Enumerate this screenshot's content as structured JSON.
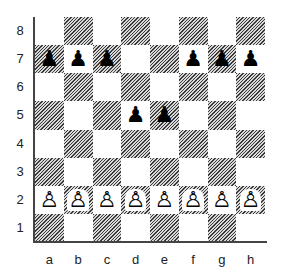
{
  "diagram": {
    "type": "chess-board",
    "ranks": [
      "8",
      "7",
      "6",
      "5",
      "4",
      "3",
      "2",
      "1"
    ],
    "files": [
      "a",
      "b",
      "c",
      "d",
      "e",
      "f",
      "g",
      "h"
    ],
    "pieces": {
      "a7": {
        "color": "black",
        "type": "pawn",
        "glyph": "♟"
      },
      "b7": {
        "color": "black",
        "type": "pawn",
        "glyph": "♟"
      },
      "c7": {
        "color": "black",
        "type": "pawn",
        "glyph": "♟"
      },
      "f7": {
        "color": "black",
        "type": "pawn",
        "glyph": "♟"
      },
      "g7": {
        "color": "black",
        "type": "pawn",
        "glyph": "♟"
      },
      "h7": {
        "color": "black",
        "type": "pawn",
        "glyph": "♟"
      },
      "d5": {
        "color": "black",
        "type": "pawn",
        "glyph": "♟"
      },
      "e5": {
        "color": "black",
        "type": "pawn",
        "glyph": "♟"
      },
      "a2": {
        "color": "white",
        "type": "pawn",
        "glyph": "♙"
      },
      "b2": {
        "color": "white",
        "type": "pawn",
        "glyph": "♙"
      },
      "c2": {
        "color": "white",
        "type": "pawn",
        "glyph": "♙"
      },
      "d2": {
        "color": "white",
        "type": "pawn",
        "glyph": "♙"
      },
      "e2": {
        "color": "white",
        "type": "pawn",
        "glyph": "♙"
      },
      "f2": {
        "color": "white",
        "type": "pawn",
        "glyph": "♙"
      },
      "g2": {
        "color": "white",
        "type": "pawn",
        "glyph": "♙"
      },
      "h2": {
        "color": "white",
        "type": "pawn",
        "glyph": "♙"
      }
    },
    "colors": {
      "light_square": "#ffffff",
      "dark_square": "hatched-gray",
      "border": "#444444"
    }
  }
}
